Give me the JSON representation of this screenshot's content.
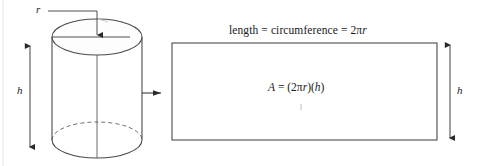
{
  "figure": {
    "background_color": "#ffffff",
    "stroke_color": "#4a4a4a",
    "text_color": "#1a1a1a"
  },
  "cylinder": {
    "name": "cylinder",
    "radius_label": "r",
    "height_label": "h",
    "top_ellipse": {
      "cx": 97,
      "cy": 37,
      "rx": 45,
      "ry": 18
    },
    "bottom_ellipse": {
      "cx": 97,
      "cy": 140,
      "rx": 45,
      "ry": 18
    },
    "left_side_x": 52,
    "right_side_x": 142,
    "center_line_x": 97,
    "top_y": 37,
    "bottom_y": 140
  },
  "height_dimension_left": {
    "label": "h",
    "x": 30,
    "y_top": 44,
    "y_bottom": 149
  },
  "radius_dimension": {
    "label": "r",
    "leader_start_x": 48,
    "leader_y": 11,
    "corner_x": 97,
    "arrow_y": 37
  },
  "transform_arrow": {
    "name": "transform-arrow",
    "direction": "right",
    "x_start": 140,
    "x_end": 160,
    "y": 93
  },
  "rectangle": {
    "name": "unrolled-rectangle",
    "x": 172,
    "y": 43,
    "width": 265,
    "height": 97,
    "top_label": "length = circumference = 2πr",
    "area_label": "A = (2πr)(h)",
    "height_label": "h"
  },
  "height_dimension_right": {
    "label": "h",
    "x": 450,
    "y_top": 43,
    "y_bottom": 140
  },
  "labels": {
    "r": "r",
    "h": "h",
    "length_expression": "length = circumference = 2πr",
    "area_expression": "A = (2πr)(h)"
  },
  "text_parts": {
    "length_prefix": "length = circumference = 2",
    "length_pi": "π",
    "length_r": "r",
    "area_A": "A",
    "area_eq": " = (2",
    "area_pi": "π",
    "area_r": "r",
    "area_close": ")(",
    "area_h": "h",
    "area_end": ")"
  },
  "page_border": {
    "name": "page-edge-line",
    "x": 3,
    "color": "#e2e2e2"
  }
}
